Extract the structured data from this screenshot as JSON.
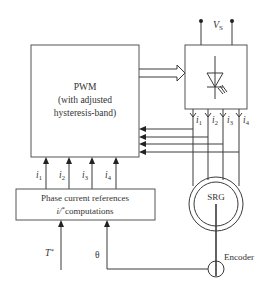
{
  "diagram": {
    "pwm_block": {
      "title": "PWM",
      "line2": "(with adjusted",
      "line3": "hysteresis-band)"
    },
    "reference_block": {
      "line1": "Phase current references",
      "line2_var": "i/",
      "line2_sup": "*",
      "line2_text": "computations"
    },
    "converter": {
      "supply_label": "V",
      "supply_sub": "S",
      "switch_symbol": "thyristor-icon"
    },
    "machine": {
      "label": "SRG"
    },
    "encoder": {
      "label": "Encoder"
    },
    "reference_currents": [
      {
        "var": "i",
        "sub": "1"
      },
      {
        "var": "i",
        "sub": "2"
      },
      {
        "var": "i",
        "sub": "3"
      },
      {
        "var": "i",
        "sub": "4"
      }
    ],
    "measured_currents": [
      {
        "var": "i",
        "sub": "1"
      },
      {
        "var": "i",
        "sub": "2"
      },
      {
        "var": "i",
        "sub": "3"
      },
      {
        "var": "i",
        "sub": "4"
      }
    ],
    "inputs": {
      "torque_var": "T",
      "torque_sup": "*",
      "angle": "θ"
    }
  }
}
